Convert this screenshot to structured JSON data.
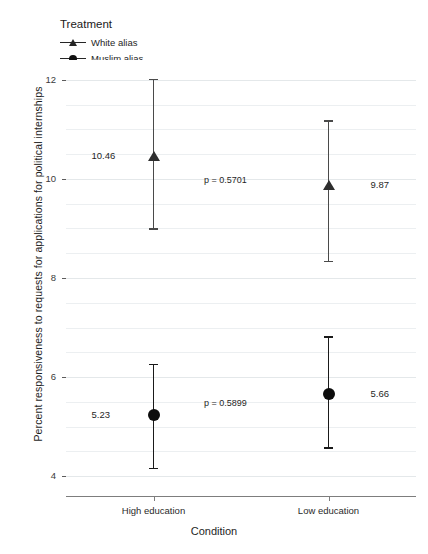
{
  "chart_data": {
    "type": "scatter",
    "title": "",
    "xlabel": "Condition",
    "ylabel": "Percent responsiveness to requests for applications for political internships",
    "categories": [
      "High education",
      "Low education"
    ],
    "ylim": [
      3.6,
      12.4
    ],
    "yticks": [
      4,
      6,
      8,
      10,
      12
    ],
    "ytick_labels": [
      "4",
      "6",
      "8",
      "10",
      "12"
    ],
    "grid": true,
    "legend_position": "top-left",
    "legend_title": "Treatment",
    "series": [
      {
        "name": "White alias",
        "marker": "triangle",
        "color": "#2e2e2e",
        "values": [
          10.46,
          9.87
        ],
        "value_labels": [
          "10.46",
          "9.87"
        ],
        "ci_low": [
          9.0,
          8.35
        ],
        "ci_high": [
          12.02,
          11.19
        ]
      },
      {
        "name": "Muslim alias",
        "marker": "circle",
        "color": "#0d0d0d",
        "values": [
          5.23,
          5.66
        ],
        "value_labels": [
          "5.23",
          "5.66"
        ],
        "ci_low": [
          4.17,
          4.59
        ],
        "ci_high": [
          6.27,
          6.83
        ]
      }
    ],
    "annotations": [
      {
        "text": "p = 0.5701",
        "series": "White alias",
        "y": 9.95
      },
      {
        "text": "p = 0.5899",
        "series": "Muslim alias",
        "y": 5.45
      }
    ]
  },
  "axis": {
    "y_title": "Percent responsiveness to requests for applications for political internships",
    "x_title": "Condition"
  },
  "legend": {
    "title": "Treatment",
    "items": [
      {
        "label": "White alias",
        "marker": "triangle"
      },
      {
        "label": "Muslim alias",
        "marker": "circle"
      }
    ]
  }
}
